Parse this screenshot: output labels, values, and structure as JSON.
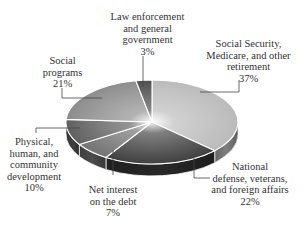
{
  "chart_data": {
    "type": "pie",
    "style": "3d-exploded-none",
    "title": "",
    "start_angle_deg": -90,
    "direction": "clockwise",
    "slices": [
      {
        "label": "Social Security, Medicare, and other retirement",
        "value": 37,
        "pct_text": "37%",
        "color": "#b9b9b9"
      },
      {
        "label": "National defense, veterans, and foreign affairs",
        "value": 22,
        "pct_text": "22%",
        "color": "#3a3a3a"
      },
      {
        "label": "Net interest on the debt",
        "value": 7,
        "pct_text": "7%",
        "color": "#6f6f6f"
      },
      {
        "label": "Physical, human, and community development",
        "value": 10,
        "pct_text": "10%",
        "color": "#5d5d5d"
      },
      {
        "label": "Social programs",
        "value": 21,
        "pct_text": "21%",
        "color": "#8a8a8a"
      },
      {
        "label": "Law enforcement and general government",
        "value": 3,
        "pct_text": "3%",
        "color": "#4a4a4a"
      }
    ],
    "legend": "none (callout labels with leader lines)"
  },
  "labels": {
    "social_security": {
      "text": "Social Security,\nMedicare, and other\nretirement\n37%"
    },
    "national_defense": {
      "text": "National\ndefense, veterans,\nand foreign affairs\n22%"
    },
    "net_interest": {
      "text": "Net interest\non the debt\n7%"
    },
    "physical": {
      "text": "Physical,\nhuman, and\ncommunity\ndevelopment\n10%"
    },
    "social_programs": {
      "text": "Social\nprograms\n21%"
    },
    "law_enforcement": {
      "text": "Law enforcement\nand general\ngovernment\n3%"
    }
  }
}
